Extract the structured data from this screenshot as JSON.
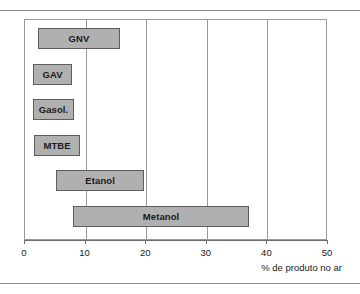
{
  "chart_data": {
    "type": "bar",
    "orientation": "horizontal",
    "bar_style": "range",
    "title": "",
    "subtitle": "",
    "xlabel": "% de produto no ar",
    "ylabel": "",
    "xlim": [
      0,
      50
    ],
    "xticks": [
      0,
      10,
      20,
      30,
      40,
      50
    ],
    "xtick_labels": [
      "0",
      "10",
      "20",
      "30",
      "40",
      "50"
    ],
    "grid": "vertical",
    "gridlines": [
      10,
      20,
      30,
      40
    ],
    "legend": "none",
    "categories": [
      "GNV",
      "GAV",
      "Gasol.",
      "MTBE",
      "Etanol",
      "Metanol"
    ],
    "bars": [
      {
        "label": "GNV",
        "start": 2.1,
        "end": 15.7
      },
      {
        "label": "GAV",
        "start": 1.3,
        "end": 7.8
      },
      {
        "label": "Gasol.",
        "start": 1.3,
        "end": 8.1
      },
      {
        "label": "MTBE",
        "start": 1.5,
        "end": 9.1
      },
      {
        "label": "Etanol",
        "start": 5.1,
        "end": 19.7
      },
      {
        "label": "Metanol",
        "start": 7.9,
        "end": 37.0
      }
    ],
    "colors": {
      "bar_fill": "#b0b0b0",
      "bar_edge": "#5d5d5d",
      "grid": "#9a9a9a",
      "axis": "#6f6f6f",
      "text": "#1a1a1a",
      "background": "#ffffff"
    }
  }
}
